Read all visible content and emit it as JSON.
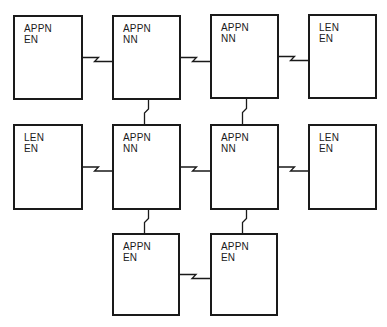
{
  "diagram": {
    "title": "",
    "nodes": [
      {
        "id": "n1",
        "type": "APPN",
        "role": "EN",
        "x": 13,
        "y": 15,
        "w": 70,
        "h": 85
      },
      {
        "id": "n2",
        "type": "APPN",
        "role": "NN",
        "x": 112,
        "y": 15,
        "w": 69,
        "h": 85
      },
      {
        "id": "n3",
        "type": "APPN",
        "role": "NN",
        "x": 210,
        "y": 14,
        "w": 69,
        "h": 85
      },
      {
        "id": "n4",
        "type": "LEN",
        "role": "EN",
        "x": 308,
        "y": 14,
        "w": 69,
        "h": 85
      },
      {
        "id": "n5",
        "type": "LEN",
        "role": "EN",
        "x": 13,
        "y": 124,
        "w": 70,
        "h": 86
      },
      {
        "id": "n6",
        "type": "APPN",
        "role": "NN",
        "x": 112,
        "y": 124,
        "w": 69,
        "h": 86
      },
      {
        "id": "n7",
        "type": "APPN",
        "role": "NN",
        "x": 210,
        "y": 124,
        "w": 69,
        "h": 86
      },
      {
        "id": "n8",
        "type": "LEN",
        "role": "EN",
        "x": 308,
        "y": 124,
        "w": 69,
        "h": 86
      },
      {
        "id": "n9",
        "type": "APPN",
        "role": "EN",
        "x": 112,
        "y": 233,
        "w": 68,
        "h": 83
      },
      {
        "id": "n10",
        "type": "APPN",
        "role": "EN",
        "x": 210,
        "y": 233,
        "w": 68,
        "h": 83
      }
    ],
    "links": [
      {
        "from": "n1",
        "to": "n2",
        "orientation": "horizontal",
        "style": "lightning"
      },
      {
        "from": "n2",
        "to": "n3",
        "orientation": "horizontal",
        "style": "lightning"
      },
      {
        "from": "n3",
        "to": "n4",
        "orientation": "horizontal",
        "style": "lightning"
      },
      {
        "from": "n5",
        "to": "n6",
        "orientation": "horizontal",
        "style": "lightning"
      },
      {
        "from": "n6",
        "to": "n7",
        "orientation": "horizontal",
        "style": "lightning"
      },
      {
        "from": "n7",
        "to": "n8",
        "orientation": "horizontal",
        "style": "lightning"
      },
      {
        "from": "n2",
        "to": "n6",
        "orientation": "vertical",
        "style": "lightning"
      },
      {
        "from": "n3",
        "to": "n7",
        "orientation": "vertical",
        "style": "lightning"
      },
      {
        "from": "n6",
        "to": "n9",
        "orientation": "vertical",
        "style": "lightning"
      },
      {
        "from": "n7",
        "to": "n10",
        "orientation": "vertical",
        "style": "lightning"
      },
      {
        "from": "n9",
        "to": "n10",
        "orientation": "horizontal",
        "style": "lightning"
      }
    ],
    "colors": {
      "line": "#1a1a1a",
      "background": "#ffffff"
    }
  }
}
